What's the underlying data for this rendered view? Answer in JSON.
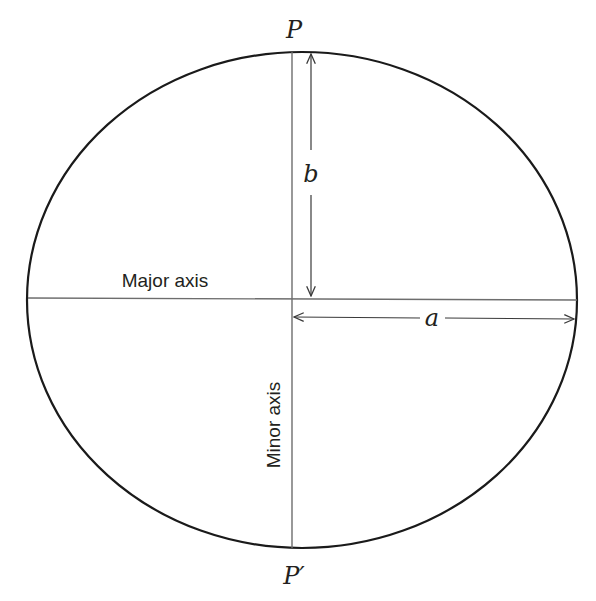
{
  "diagram": {
    "labels": {
      "top_point": "P",
      "bottom_point": "P′",
      "semi_minor": "b",
      "semi_major": "a",
      "major_axis": "Major axis",
      "minor_axis": "Minor axis"
    },
    "geometry": {
      "ellipse_center": [
        302,
        300
      ],
      "ellipse_rx": 275,
      "ellipse_ry": 248,
      "major_axis_y": 298,
      "minor_axis_x": 292
    },
    "colors": {
      "outline": "#1a1a1a",
      "axis_lines": "#6d6d6d",
      "arrows": "#3a3a3a",
      "text": "#231f20",
      "background": "#ffffff"
    }
  }
}
